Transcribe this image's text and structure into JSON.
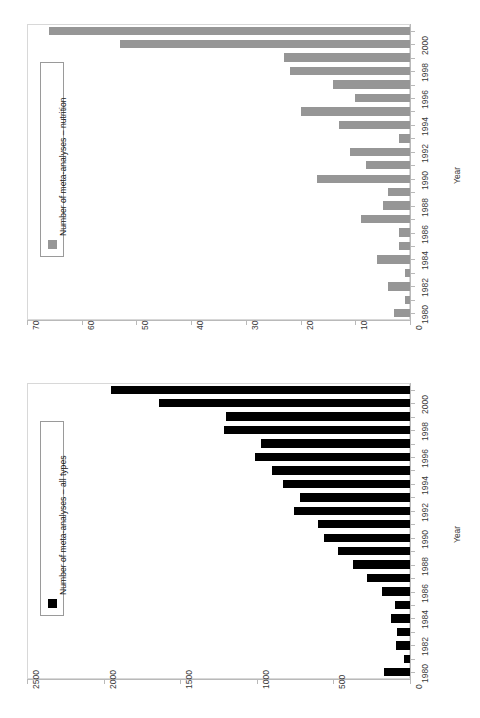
{
  "figure": {
    "orientation": "rotated-90-ccw",
    "background": "#ffffff",
    "panels": 2
  },
  "charts": [
    {
      "id": "nutrition",
      "legend_label": "Number of meta-analyses – nutrition",
      "bar_color": "#969696",
      "axis_title": "Year",
      "value_ticks": [
        "0",
        "10",
        "20",
        "30",
        "40",
        "50",
        "60",
        "70"
      ],
      "category_ticks": [
        "1980",
        "1982",
        "1984",
        "1986",
        "1988",
        "1990",
        "1992",
        "1994",
        "1996",
        "1998",
        "2000"
      ]
    },
    {
      "id": "all-types",
      "legend_label": "Number of meta-analyses – all types",
      "bar_color": "#000000",
      "axis_title": "Year",
      "value_ticks": [
        "0",
        "500",
        "1000",
        "1500",
        "2000",
        "2500"
      ],
      "category_ticks": [
        "1980",
        "1982",
        "1984",
        "1986",
        "1988",
        "1990",
        "1992",
        "1994",
        "1996",
        "1998",
        "2000"
      ]
    }
  ],
  "chart_data": [
    {
      "type": "bar",
      "id": "nutrition",
      "orientation": "horizontal",
      "title": "",
      "xlabel": "Number of meta-analyses – nutrition",
      "ylabel": "Year",
      "xlim": [
        0,
        70
      ],
      "ylim": [
        1980,
        2001
      ],
      "grid": false,
      "legend": [
        "Number of meta-analyses – nutrition"
      ],
      "legend_position": "center-left-inside",
      "categories": [
        "1980",
        "1981",
        "1982",
        "1983",
        "1984",
        "1985",
        "1986",
        "1987",
        "1988",
        "1989",
        "1990",
        "1991",
        "1992",
        "1993",
        "1994",
        "1995",
        "1996",
        "1997",
        "1998",
        "1999",
        "2000",
        "2001"
      ],
      "values": [
        3,
        1,
        4,
        1,
        6,
        2,
        2,
        9,
        5,
        4,
        17,
        8,
        11,
        2,
        13,
        20,
        10,
        14,
        22,
        23,
        53,
        66
      ]
    },
    {
      "type": "bar",
      "id": "all-types",
      "orientation": "horizontal",
      "title": "",
      "xlabel": "Number of meta-analyses – all types",
      "ylabel": "Year",
      "xlim": [
        0,
        2500
      ],
      "ylim": [
        1980,
        2001
      ],
      "grid": false,
      "legend": [
        "Number of meta-analyses – all types"
      ],
      "legend_position": "center-left-inside",
      "categories": [
        "1980",
        "1981",
        "1982",
        "1983",
        "1984",
        "1985",
        "1986",
        "1987",
        "1988",
        "1989",
        "1990",
        "1991",
        "1992",
        "1993",
        "1994",
        "1995",
        "1996",
        "1997",
        "1998",
        "1999",
        "2000",
        "2001"
      ],
      "values": [
        170,
        40,
        90,
        85,
        125,
        95,
        180,
        280,
        370,
        470,
        560,
        600,
        760,
        720,
        830,
        900,
        1010,
        970,
        1215,
        1200,
        1640,
        1950
      ]
    }
  ]
}
